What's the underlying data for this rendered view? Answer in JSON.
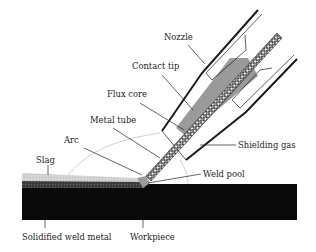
{
  "diagram": {
    "type": "flux-cored arc welding cross-section",
    "labels": {
      "nozzle": "Nozzle",
      "contact_tip": "Contact tip",
      "flux_core": "Flux core",
      "metal_tube": "Metal tube",
      "arc": "Arc",
      "slag": "Slag",
      "shielding_gas": "Shielding gas",
      "weld_pool": "Weld pool",
      "solidified_weld_metal": "Solidified weld metal",
      "workpiece": "Workpiece"
    },
    "colors": {
      "workpiece": "#0a0a0a",
      "slag": "#d0d0d0",
      "solidified_weld_metal": "#3a3a3a",
      "contact_tip": "#9a9a9a",
      "nozzle_outline": "#1a1a1a",
      "background": "#ffffff"
    }
  }
}
